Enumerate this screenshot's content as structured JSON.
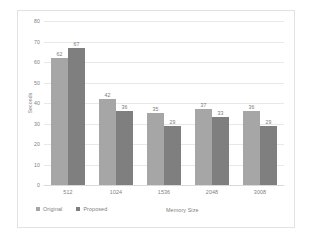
{
  "chart_data": {
    "type": "bar",
    "title": "",
    "xlabel": "Memory Size",
    "ylabel": "Seconds",
    "categories": [
      "512",
      "1024",
      "1536",
      "2048",
      "3008"
    ],
    "series": [
      {
        "name": "Original",
        "color": "#a6a6a6",
        "values": [
          62,
          42,
          35,
          37,
          36
        ]
      },
      {
        "name": "Proposed",
        "color": "#7f7f7f",
        "values": [
          67,
          36,
          29,
          33,
          29
        ]
      }
    ],
    "ylim": [
      0,
      80
    ],
    "yticks": [
      0,
      10,
      20,
      30,
      40,
      50,
      60,
      70,
      80
    ],
    "ytick_labels": [
      "0",
      "10",
      "20",
      "30",
      "40",
      "50",
      "60",
      "70",
      "80"
    ],
    "grid": "horizontal",
    "legend_position": "bottom-left",
    "data_labels": true,
    "background_color": "#ffffff",
    "gridline_color": "#e8e8e8",
    "text_color": "#808080",
    "border_color": "#e2e2e2"
  }
}
